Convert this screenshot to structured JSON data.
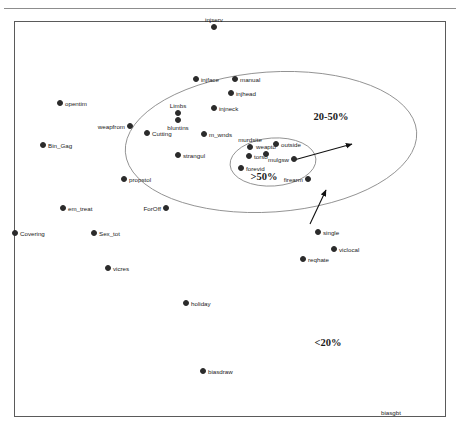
{
  "header": {
    "text": ""
  },
  "chart_data": {
    "type": "scatter",
    "title": "",
    "xlabel": "",
    "ylabel": "",
    "grid": false,
    "legend_position": "none",
    "xlim": [
      0,
      1
    ],
    "ylim": [
      0,
      1
    ],
    "points": [
      {
        "label": "injserv",
        "x": 214,
        "y": 27,
        "anchor": "above",
        "marker": "filled"
      },
      {
        "label": "injface",
        "x": 196,
        "y": 79,
        "anchor": "right",
        "marker": "filled"
      },
      {
        "label": "manual",
        "x": 235,
        "y": 79,
        "anchor": "right",
        "marker": "filled"
      },
      {
        "label": "injhead",
        "x": 231,
        "y": 93,
        "anchor": "right",
        "marker": "filled"
      },
      {
        "label": "injneck",
        "x": 214,
        "y": 108,
        "anchor": "right",
        "marker": "filled"
      },
      {
        "label": "opentim",
        "x": 60,
        "y": 103,
        "anchor": "right",
        "marker": "filled"
      },
      {
        "label": "Limbs",
        "x": 178,
        "y": 113,
        "anchor": "above",
        "marker": "filled"
      },
      {
        "label": "bluntins",
        "x": 178,
        "y": 120,
        "anchor": "below",
        "marker": "filled"
      },
      {
        "label": "weapfrom",
        "x": 130,
        "y": 126,
        "anchor": "left",
        "marker": "filled"
      },
      {
        "label": "Cutting",
        "x": 147,
        "y": 133,
        "anchor": "right",
        "marker": "filled"
      },
      {
        "label": "m_wnds",
        "x": 204,
        "y": 134,
        "anchor": "right",
        "marker": "filled"
      },
      {
        "label": "Bin_Gag",
        "x": 43,
        "y": 145,
        "anchor": "right",
        "marker": "filled"
      },
      {
        "label": "murdsite",
        "x": 250,
        "y": 147,
        "anchor": "above",
        "marker": "filled"
      },
      {
        "label": "outside",
        "x": 276,
        "y": 144,
        "anchor": "right",
        "marker": "filled"
      },
      {
        "label": "torso",
        "x": 249,
        "y": 156,
        "anchor": "right",
        "marker": "filled"
      },
      {
        "label": "weapto",
        "x": 266,
        "y": 154,
        "anchor": "above",
        "marker": "filled"
      },
      {
        "label": "mulgsw",
        "x": 294,
        "y": 159,
        "anchor": "left",
        "marker": "filled"
      },
      {
        "label": "strangul",
        "x": 178,
        "y": 155,
        "anchor": "right",
        "marker": "filled"
      },
      {
        "label": "forevid",
        "x": 241,
        "y": 168,
        "anchor": "right",
        "marker": "filled"
      },
      {
        "label": "firearm",
        "x": 308,
        "y": 179,
        "anchor": "left",
        "marker": "filled"
      },
      {
        "label": "propstol",
        "x": 124,
        "y": 179,
        "anchor": "right",
        "marker": "filled"
      },
      {
        "label": "ForOff",
        "x": 166,
        "y": 208,
        "anchor": "left",
        "marker": "filled"
      },
      {
        "label": "em_treat",
        "x": 63,
        "y": 208,
        "anchor": "right",
        "marker": "filled"
      },
      {
        "label": "Covering",
        "x": 15,
        "y": 233,
        "anchor": "right",
        "marker": "filled"
      },
      {
        "label": "Sex_tot",
        "x": 94,
        "y": 233,
        "anchor": "right",
        "marker": "filled"
      },
      {
        "label": "single",
        "x": 318,
        "y": 232,
        "anchor": "right",
        "marker": "filled"
      },
      {
        "label": "viclocal",
        "x": 334,
        "y": 249,
        "anchor": "right",
        "marker": "filled"
      },
      {
        "label": "reqhate",
        "x": 303,
        "y": 259,
        "anchor": "right",
        "marker": "filled"
      },
      {
        "label": "vicres",
        "x": 108,
        "y": 268,
        "anchor": "right",
        "marker": "filled"
      },
      {
        "label": "holiday",
        "x": 186,
        "y": 303,
        "anchor": "right",
        "marker": "filled"
      },
      {
        "label": "biasdraw",
        "x": 203,
        "y": 371,
        "anchor": "right",
        "marker": "filled"
      }
    ],
    "region_labels": [
      {
        "text": ">50%",
        "x": 264,
        "y": 176
      },
      {
        "text": "20-50%",
        "x": 331,
        "y": 116
      },
      {
        "text": "<20%",
        "x": 328,
        "y": 342
      }
    ],
    "contours": [
      {
        "name": "outer-ellipse",
        "cx": 271,
        "cy": 142,
        "rx": 146,
        "ry": 70,
        "rotate": -4
      },
      {
        "name": "inner-ellipse",
        "cx": 273,
        "cy": 162,
        "rx": 43,
        "ry": 24,
        "rotate": -4
      }
    ],
    "arrows": [
      {
        "name": "upper-arrow",
        "x1": 294,
        "y1": 160,
        "x2": 352,
        "y2": 144
      },
      {
        "name": "lower-arrow",
        "x1": 310,
        "y1": 224,
        "x2": 326,
        "y2": 190
      }
    ],
    "axis_ticks": [
      {
        "text": "biasgbt",
        "x": 381,
        "y": 409
      }
    ]
  }
}
